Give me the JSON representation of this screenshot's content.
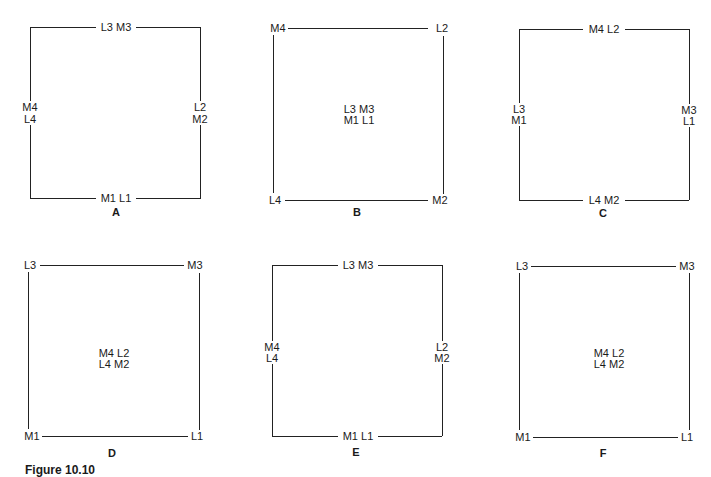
{
  "figure": {
    "caption_label": "Figure 10.10",
    "caption_text": ""
  },
  "panels": {
    "A": {
      "letter": "A",
      "top": "L3 M3",
      "bottom": "M1 L1",
      "left": [
        "M4",
        "L4"
      ],
      "right": [
        "L2",
        "M2"
      ]
    },
    "B": {
      "letter": "B",
      "top_left": "M4",
      "top_right": "L2",
      "bottom_left": "L4",
      "bottom_right": "M2",
      "center": [
        "L3 M3",
        "M1 L1"
      ]
    },
    "C": {
      "letter": "C",
      "top": "M4 L2",
      "bottom": "L4 M2",
      "left": [
        "L3",
        "M1"
      ],
      "right": [
        "M3",
        "L1"
      ]
    },
    "D": {
      "letter": "D",
      "top_left": "L3",
      "top_right": "M3",
      "bottom_left": "M1",
      "bottom_right": "L1",
      "center": [
        "M4 L2",
        "L4 M2"
      ]
    },
    "E": {
      "letter": "E",
      "top": "L3 M3",
      "bottom": "M1 L1",
      "left": [
        "M4",
        "L4"
      ],
      "right": [
        "L2",
        "M2"
      ]
    },
    "F": {
      "letter": "F",
      "top_left": "L3",
      "top_right": "M3",
      "bottom_left": "M1",
      "bottom_right": "L1",
      "center": [
        "M4 L2",
        "L4 M2"
      ]
    }
  }
}
